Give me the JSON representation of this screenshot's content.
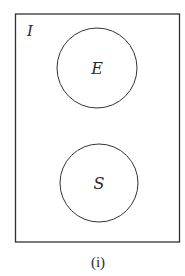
{
  "diagram": {
    "type": "venn",
    "universe": {
      "label": "I"
    },
    "sets": [
      {
        "label": "E"
      },
      {
        "label": "S"
      }
    ],
    "caption": "(i)",
    "colors": {
      "stroke": "#333333",
      "background": "#ffffff"
    }
  }
}
